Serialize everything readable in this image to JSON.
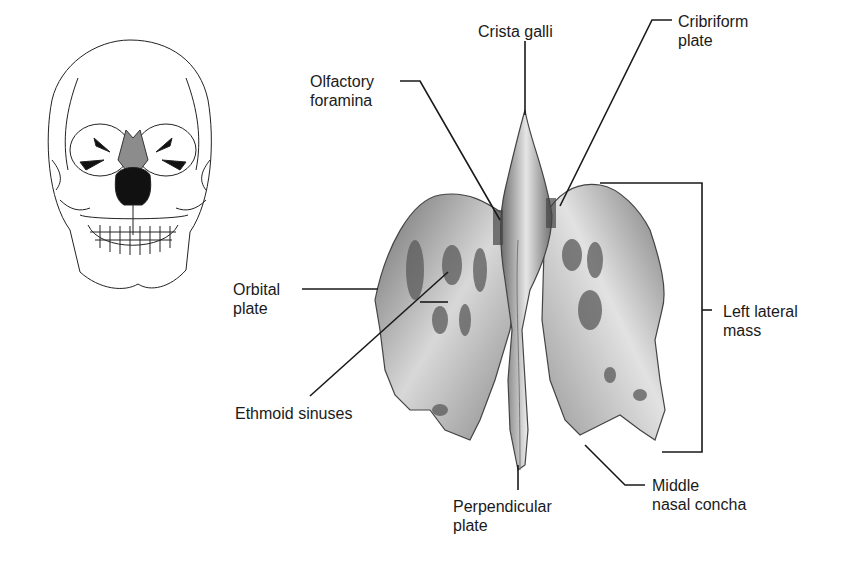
{
  "figure": {
    "labels": {
      "crista_galli": "Crista galli",
      "cribriform_plate": [
        "Cribriform",
        "plate"
      ],
      "olfactory_foramina": [
        "Olfactory",
        "foramina"
      ],
      "orbital_plate": [
        "Orbital",
        "plate"
      ],
      "ethmoid_sinuses": "Ethmoid sinuses",
      "left_lateral_mass": [
        "Left lateral",
        "mass"
      ],
      "perpendicular_plate": [
        "Perpendicular",
        "plate"
      ],
      "middle_nasal_concha": [
        "Middle",
        "nasal concha"
      ]
    },
    "colors": {
      "line": "#1a1a1a",
      "bone_dark": "#5a5a5a",
      "bone_mid": "#9a9a9a",
      "bone_light": "#e8e8e8",
      "highlight": "#8c8c8c"
    }
  }
}
